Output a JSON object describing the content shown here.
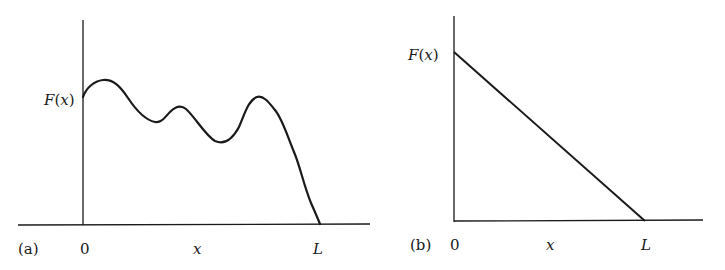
{
  "panels": [
    {
      "id": "a",
      "tag": "(a)",
      "y_label": "F(x)",
      "x_label": "x",
      "x_ticks": [
        "0",
        "L"
      ],
      "curve_description": "arbitrary wavy function F(x) starting positive at 0 and falling to zero at L"
    },
    {
      "id": "b",
      "tag": "(b)",
      "y_label": "F(x)",
      "x_label": "x",
      "x_ticks": [
        "0",
        "L"
      ],
      "curve_description": "linear function decreasing from F(0) to zero at L"
    }
  ],
  "colors": {
    "line": "#1a1a1a",
    "background": "#ffffff"
  }
}
